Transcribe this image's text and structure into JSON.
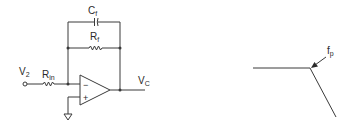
{
  "circuit": {
    "type": "inverting-integrator-with-feedback-resistor",
    "labels": {
      "input_voltage": "V",
      "input_voltage_sub": "2",
      "input_resistor": "R",
      "input_resistor_sub": "in",
      "feedback_capacitor": "C",
      "feedback_capacitor_sub": "f",
      "feedback_resistor": "R",
      "feedback_resistor_sub": "f",
      "output_voltage": "V",
      "output_voltage_sub": "C",
      "inverting_input": "−",
      "noninverting_input": "+"
    },
    "components": [
      "input-terminal",
      "R_in",
      "op-amp",
      "C_f",
      "R_f",
      "ground"
    ]
  },
  "response_plot": {
    "type": "bode-magnitude-sketch",
    "annotation": "f",
    "annotation_sub": "p",
    "segments": [
      {
        "name": "flat",
        "slope": "0"
      },
      {
        "name": "rolloff",
        "slope": "negative"
      }
    ],
    "colors": {
      "line": "#3a3a3a",
      "background": "#ffffff"
    }
  }
}
